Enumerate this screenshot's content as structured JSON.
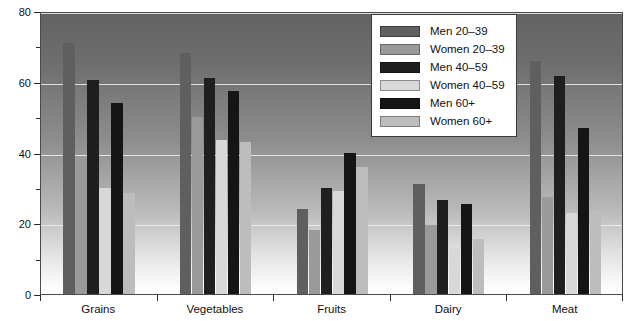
{
  "chart_data": {
    "type": "bar",
    "title": "",
    "xlabel": "",
    "ylabel": "",
    "ylim": [
      0,
      80
    ],
    "yticks": [
      0,
      20,
      40,
      60,
      80
    ],
    "ytick_labels": [
      "0",
      "20",
      "40",
      "60",
      "80"
    ],
    "yminor_step": 10,
    "grid": true,
    "legend_position": "top-right",
    "categories": [
      "Grains",
      "Vegetables",
      "Fruits",
      "Dairy",
      "Meat"
    ],
    "series": [
      {
        "name": "Men 20–39",
        "color": "#5f5f5f",
        "values": [
          71,
          68,
          24,
          31,
          66
        ]
      },
      {
        "name": "Women 20–39",
        "color": "#9a9a9a",
        "values": [
          39,
          50,
          18,
          19.5,
          27.5
        ]
      },
      {
        "name": "Men 40–59",
        "color": "#1f1f1f",
        "values": [
          60.5,
          61,
          30,
          26.5,
          61.5
        ]
      },
      {
        "name": "Women 40–59",
        "color": "#d8d8d8",
        "values": [
          30,
          43.5,
          29,
          13,
          23
        ]
      },
      {
        "name": "Men 60+",
        "color": "#151515",
        "values": [
          54,
          57.5,
          40,
          25.5,
          47
        ]
      },
      {
        "name": "Women 60+",
        "color": "#bdbdbd",
        "values": [
          28.5,
          43,
          36,
          15.5,
          23.5
        ]
      }
    ]
  },
  "legend": {
    "items": [
      {
        "label": "Men 20–39",
        "color": "#5f5f5f"
      },
      {
        "label": "Women 20–39",
        "color": "#9a9a9a"
      },
      {
        "label": "Men 40–59",
        "color": "#1f1f1f"
      },
      {
        "label": "Women 40–59",
        "color": "#d8d8d8"
      },
      {
        "label": "Men 60+",
        "color": "#151515"
      },
      {
        "label": "Women 60+",
        "color": "#bdbdbd"
      }
    ]
  }
}
